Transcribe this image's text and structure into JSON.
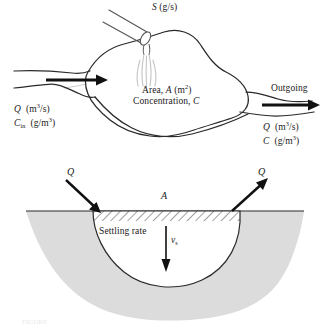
{
  "figure": {
    "background_color": "#ffffff",
    "ink_color": "#1a1a1a",
    "sediment_fill_color": "#dcdcdc",
    "water_outline_color": "#2a2a2a",
    "plume_color": "#c9c9c9"
  },
  "plan_view": {
    "name": "plan-view-lake",
    "source_label": {
      "symbol": "S",
      "units": "(g/s)",
      "full": "S (g/s)"
    },
    "interior_labels": {
      "area_prefix": "Area,",
      "area_symbol": "A",
      "area_units_open": "(m",
      "area_units_exp": "2",
      "area_units_close": ")",
      "area_full": "Area, A (m2)",
      "concentration_prefix": "Concentration,",
      "concentration_symbol": "C",
      "concentration_full": "Concentration, C"
    },
    "inflow": {
      "flow_symbol": "Q",
      "flow_units_open": "(m",
      "flow_units_exp": "3",
      "flow_units_close": "/s)",
      "flow_full": "Q (m3/s)",
      "conc_symbol": "C",
      "conc_subscript": "in",
      "conc_units_open": "(g/m",
      "conc_units_exp": "3",
      "conc_units_close": ")",
      "conc_full": "Cin (g/m3)"
    },
    "outflow": {
      "heading": "Outgoing",
      "flow_symbol": "Q",
      "flow_units_open": "(m",
      "flow_units_exp": "3",
      "flow_units_close": "/s)",
      "flow_full": "Q (m3/s)",
      "conc_symbol": "C",
      "conc_units_open": "(g/m",
      "conc_units_exp": "3",
      "conc_units_close": ")",
      "conc_full": "C (g/m3)"
    }
  },
  "cross_section": {
    "name": "cross-section-settling",
    "inflow_symbol": "Q",
    "outflow_symbol": "Q",
    "surface_area_symbol": "A",
    "settling_label": "Settling rate",
    "settling_velocity_symbol": "v",
    "settling_velocity_subscript": "s",
    "settling_velocity_full": "vs"
  },
  "caption": {
    "text": "FIGURE"
  }
}
